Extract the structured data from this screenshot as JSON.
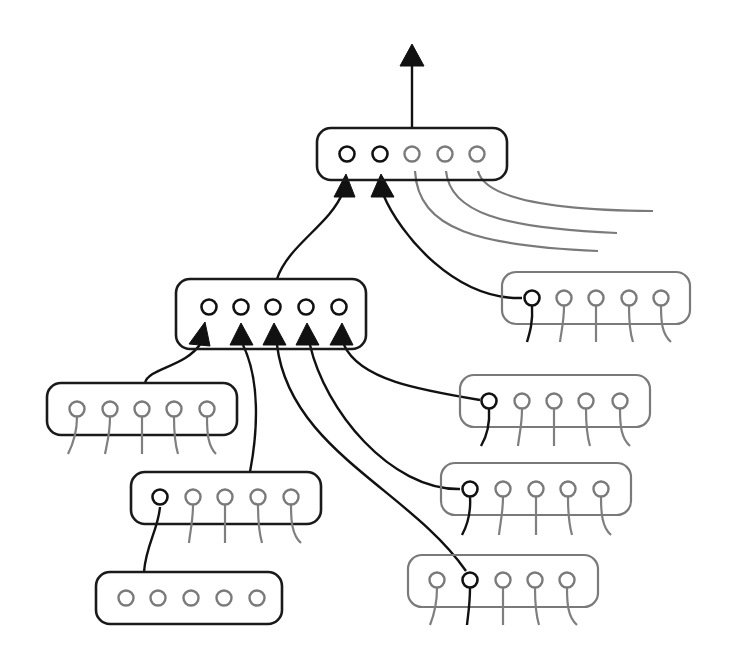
{
  "diagram": {
    "title": "",
    "colors": {
      "active": "#111111",
      "inactive": "#7a7a7a",
      "background": "#ffffff"
    },
    "groups": [
      {
        "id": "top",
        "label": "",
        "cx": [
          347,
          380,
          412,
          445,
          477
        ],
        "cy": 154,
        "box": [
          317,
          128,
          190,
          52
        ],
        "style": "dark",
        "active_nodes": [
          0,
          1
        ]
      },
      {
        "id": "middle",
        "label": "",
        "cx": [
          209,
          241,
          273,
          306,
          339
        ],
        "cy": 307,
        "box": [
          176,
          279,
          190,
          70
        ],
        "style": "dark",
        "active_nodes": [
          0,
          1,
          2,
          3,
          4
        ]
      },
      {
        "id": "right-1",
        "label": "",
        "cx": [
          532,
          564,
          596,
          629,
          661
        ],
        "cy": 298,
        "box": [
          502,
          272,
          188,
          52
        ],
        "style": "gray",
        "active_nodes": [
          0
        ]
      },
      {
        "id": "left-1",
        "label": "",
        "cx": [
          77,
          110,
          142,
          174,
          207
        ],
        "cy": 409,
        "box": [
          47,
          383,
          190,
          52
        ],
        "style": "dark",
        "active_nodes": []
      },
      {
        "id": "right-2",
        "label": "",
        "cx": [
          489,
          522,
          554,
          586,
          620
        ],
        "cy": 401,
        "box": [
          460,
          375,
          190,
          52
        ],
        "style": "gray",
        "active_nodes": [
          0
        ]
      },
      {
        "id": "left-2",
        "label": "",
        "cx": [
          160,
          193,
          225,
          258,
          291
        ],
        "cy": 497,
        "box": [
          131,
          472,
          190,
          52
        ],
        "style": "dark",
        "active_nodes": [
          0
        ]
      },
      {
        "id": "right-3",
        "label": "",
        "cx": [
          470,
          503,
          536,
          568,
          601
        ],
        "cy": 489,
        "box": [
          441,
          463,
          190,
          52
        ],
        "style": "gray",
        "active_nodes": [
          0
        ]
      },
      {
        "id": "bottom-left",
        "label": "",
        "cx": [
          126,
          158,
          191,
          224,
          257
        ],
        "cy": 598,
        "box": [
          96,
          572,
          186,
          52
        ],
        "style": "dark",
        "active_nodes": []
      },
      {
        "id": "bottom-right",
        "label": "",
        "cx": [
          437,
          470,
          503,
          535,
          567
        ],
        "cy": 580,
        "box": [
          408,
          555,
          190,
          52
        ],
        "style": "gray",
        "active_nodes": [
          1
        ]
      }
    ],
    "output_arrow": {
      "label": "",
      "from": [
        412,
        128
      ],
      "to": [
        412,
        45
      ]
    }
  }
}
